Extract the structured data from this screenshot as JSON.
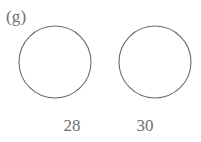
{
  "figure": {
    "type": "venn-diagram",
    "part_label": "(g)",
    "line_color": "#6b6b6b",
    "intersection_fill": "#e0e0e0",
    "background": "#ffffff",
    "circles": [
      {
        "id": "left",
        "name": "left-set",
        "cx": 55,
        "cy": 62,
        "r": 36,
        "fill": "#ffffff",
        "count": "28"
      },
      {
        "id": "right",
        "name": "right-set",
        "cx": 155,
        "cy": 62,
        "r": 36,
        "fill": "#ffffff",
        "count": "30"
      }
    ],
    "counts": {
      "left": "28",
      "right": "30"
    },
    "shaded_region": "intersection"
  }
}
